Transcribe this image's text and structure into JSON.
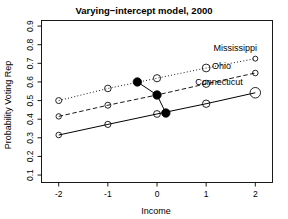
{
  "chart_data": {
    "type": "line",
    "title": "Varying−intercept model, 2000",
    "xlabel": "Income",
    "ylabel": "Probability Voting Rep",
    "xlim": [
      -2.35,
      2.35
    ],
    "ylim": [
      0.06,
      0.93
    ],
    "xticks": [
      -2,
      -1,
      0,
      1,
      2
    ],
    "xticklabels": [
      "-2",
      "-1",
      "0",
      "1",
      "2"
    ],
    "yticks": [
      0.1,
      0.2,
      0.3,
      0.4,
      0.5,
      0.6,
      0.7,
      0.8,
      0.9
    ],
    "yticklabels": [
      "0.1",
      "0.2",
      "0.3",
      "0.4",
      "0.5",
      "0.6",
      "0.7",
      "0.8",
      "0.9"
    ],
    "grid": false,
    "legend_position": "inline-right-annotations",
    "x": [
      -2,
      -1,
      0,
      1,
      2
    ],
    "series": [
      {
        "name": "Mississippi",
        "linestyle": "dotted",
        "values": [
          0.5,
          0.565,
          0.62,
          0.675,
          0.725
        ],
        "marker": "open-circle",
        "marker_sizes": [
          6.0,
          6.6,
          7.2,
          7.8,
          5.0
        ],
        "label_x": 1.15,
        "label_y": 0.765
      },
      {
        "name": "Ohio",
        "linestyle": "dashed",
        "values": [
          0.415,
          0.475,
          0.53,
          0.59,
          0.648
        ],
        "marker": "open-circle",
        "marker_sizes": [
          5.4,
          6.0,
          6.6,
          7.2,
          5.6
        ],
        "label_x": 1.12,
        "label_y": 0.668
      },
      {
        "name": "Connecticut",
        "linestyle": "solid",
        "values": [
          0.315,
          0.372,
          0.428,
          0.483,
          0.542
        ],
        "marker": "open-circle",
        "marker_sizes": [
          5.6,
          6.2,
          6.8,
          7.4,
          10.5
        ],
        "label_x": 0.78,
        "label_y": 0.585
      }
    ],
    "highlight_points": {
      "name": "state-intercept-path",
      "marker": "filled-circle",
      "points": [
        {
          "x": -0.4,
          "y": 0.6
        },
        {
          "x": 0.0,
          "y": 0.53
        },
        {
          "x": 0.18,
          "y": 0.433
        }
      ]
    }
  },
  "axes": {
    "title": "Varying−intercept model, 2000",
    "x_axis_label": "Income",
    "y_axis_label": "Probability Voting Rep"
  }
}
